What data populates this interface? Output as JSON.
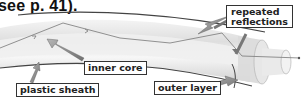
{
  "caption": "see p. 41).",
  "diagram": {
    "labels": {
      "repeated_reflections": [
        "repeated",
        "reflections"
      ],
      "inner_core": "inner core",
      "plastic_sheath": "plastic sheath",
      "outer_layer": "outer layer"
    },
    "colors": {
      "fibre_fill": "#e9e9e9",
      "fibre_edge": "#555555",
      "ray": "#777777",
      "arrow": "#8a8a8a",
      "label_border": "#333333"
    }
  }
}
